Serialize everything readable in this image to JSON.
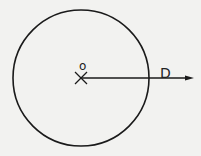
{
  "diagram": {
    "circle": {
      "cx": 81,
      "cy": 78,
      "r": 68
    },
    "center_label": "o",
    "ray_label": "D",
    "ray": {
      "x1": 81,
      "y1": 78,
      "x2": 193,
      "y2": 78
    },
    "stroke_color": "#1a1a1a",
    "background": "#f2f2f0"
  }
}
